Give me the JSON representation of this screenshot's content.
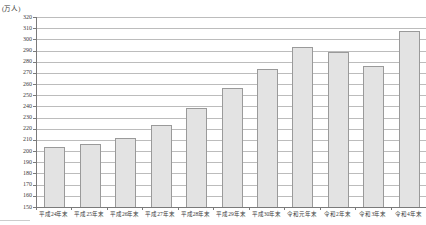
{
  "chart_data": {
    "type": "bar",
    "title": "",
    "unit_label": "(万人)",
    "categories": [
      "平成24年末",
      "平成25年末",
      "平成26年末",
      "平成27年末",
      "平成28年末",
      "平成29年末",
      "平成30年末",
      "令和元年末",
      "令和2年末",
      "令和3年末",
      "令和4年末"
    ],
    "values": [
      203.4,
      206.6,
      212.1,
      223.2,
      238.2,
      256.2,
      273.1,
      293.3,
      288.7,
      276.1,
      307.5
    ],
    "xlabel": "",
    "ylabel": "(万人)",
    "ylim": [
      150,
      320
    ],
    "y_tick_step": 10,
    "y_ticks": [
      150,
      160,
      170,
      180,
      190,
      200,
      210,
      220,
      230,
      240,
      250,
      260,
      270,
      280,
      290,
      300,
      310,
      320
    ],
    "grid": true,
    "legend": "none",
    "colors": {
      "bar_fill": "#e3e3e3",
      "bar_border": "#9a9a9a",
      "gridline": "#bcbcbc",
      "axis": "#7a7a7a",
      "text": "#3a3a3a",
      "background": "#ffffff"
    }
  }
}
